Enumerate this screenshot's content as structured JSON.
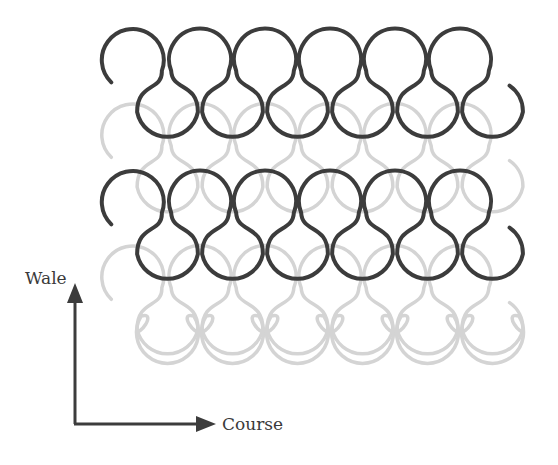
{
  "diagram": {
    "axes": {
      "wale_label": "Wale",
      "course_label": "Course"
    },
    "colors": {
      "dark_yarn": "#3c3c3c",
      "light_yarn": "#d4d4d4",
      "arrow": "#3c3c3c",
      "background": "#ffffff"
    },
    "layout": {
      "pitch": 65,
      "radius": 31,
      "first_head_cx": 135,
      "stitches_per_row": 6,
      "rows": [
        {
          "name": "course-1",
          "color": "dark",
          "head_cy": 60,
          "layer": 2
        },
        {
          "name": "course-2",
          "color": "light",
          "head_cy": 135,
          "layer": 1
        },
        {
          "name": "course-3",
          "color": "dark",
          "head_cy": 202,
          "layer": 2
        },
        {
          "name": "course-4",
          "color": "light",
          "head_cy": 277,
          "layer": 1
        }
      ],
      "bottom_row_full_loops_cy": 330
    }
  }
}
